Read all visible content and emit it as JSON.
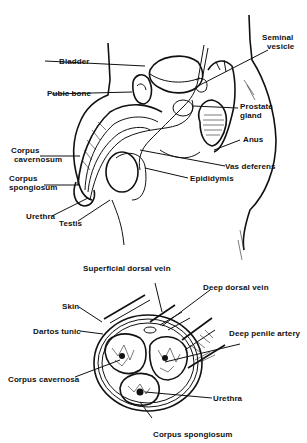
{
  "figure": {
    "top_diagram": {
      "title": "Sagittal view of male reproductive anatomy",
      "labels": {
        "seminal_vesicle": "Seminal vesicle",
        "seminal_vesicle_l1": "Seminal",
        "seminal_vesicle_l2": "vesicle",
        "bladder": "Bladder",
        "pubic_bone": "Pubic bone",
        "prostate_l1": "Prostate",
        "prostate_l2": "gland",
        "anus": "Anus",
        "corpus_cavernosum_l1": "Corpus",
        "corpus_cavernosum_l2": "cavernosum",
        "vas_deferens": "Vas deferens",
        "corpus_spongiosum_l1": "Corpus",
        "corpus_spongiosum_l2": "spongiosum",
        "epididymis": "Epididymis",
        "urethra": "Urethra",
        "testis": "Testis"
      }
    },
    "bottom_diagram": {
      "title": "Cross-section of penis",
      "labels": {
        "superficial_dorsal_vein": "Superficial dorsal vein",
        "deep_dorsal_vein": "Deep dorsal vein",
        "skin": "Skin",
        "dartos_tunic": "Dartos tunic",
        "deep_penile_artery": "Deep penile artery",
        "corpus_cavernosa": "Corpus cavernosa",
        "urethra": "Urethra",
        "corpus_spongiosum": "Corpus spongiosum"
      }
    }
  }
}
